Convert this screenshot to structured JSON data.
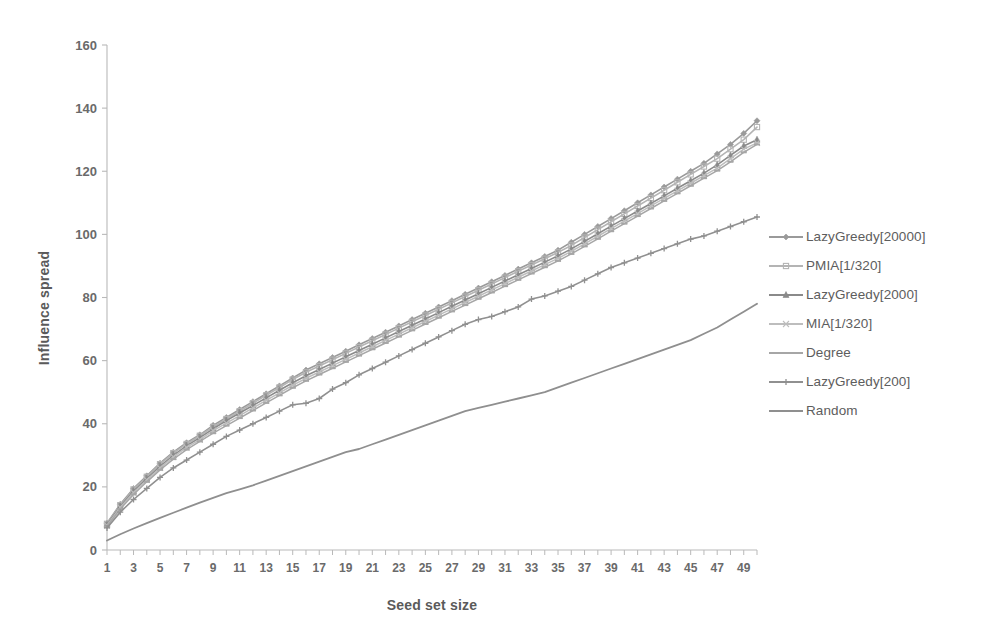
{
  "chart_data": {
    "type": "line",
    "title": "",
    "xlabel": "Seed set size",
    "ylabel": "Influence spread",
    "xlim": [
      1,
      50
    ],
    "ylim": [
      0,
      160
    ],
    "ytick_values": [
      0,
      20,
      40,
      60,
      80,
      100,
      120,
      140,
      160
    ],
    "ytick_labels": [
      "0",
      "20",
      "40",
      "60",
      "80",
      "100",
      "120",
      "140",
      "160"
    ],
    "xtick_values": [
      1,
      3,
      5,
      7,
      9,
      11,
      13,
      15,
      17,
      19,
      21,
      23,
      25,
      27,
      29,
      31,
      33,
      35,
      37,
      39,
      41,
      43,
      45,
      47,
      49
    ],
    "xtick_labels": [
      "1",
      "3",
      "5",
      "7",
      "9",
      "11",
      "13",
      "15",
      "17",
      "19",
      "21",
      "23",
      "25",
      "27",
      "29",
      "31",
      "33",
      "35",
      "37",
      "39",
      "41",
      "43",
      "45",
      "47",
      "49"
    ],
    "x": [
      1,
      2,
      3,
      4,
      5,
      6,
      7,
      8,
      9,
      10,
      11,
      12,
      13,
      14,
      15,
      16,
      17,
      18,
      19,
      20,
      21,
      22,
      23,
      24,
      25,
      26,
      27,
      28,
      29,
      30,
      31,
      32,
      33,
      34,
      35,
      36,
      37,
      38,
      39,
      40,
      41,
      42,
      43,
      44,
      45,
      46,
      47,
      48,
      49,
      50
    ],
    "grid": false,
    "legend_position": "right",
    "series": [
      {
        "name": "LazyGreedy[20000]",
        "color": "#9a9a9a",
        "marker": "diamond",
        "width": 1.6,
        "values": [
          8.5,
          14.5,
          19.5,
          23.5,
          27.5,
          31,
          34,
          36.5,
          39.5,
          42,
          44.5,
          47,
          49.5,
          52,
          54.5,
          57,
          59,
          61,
          63,
          65,
          67,
          69,
          71,
          73,
          75,
          77,
          79,
          81,
          83,
          85,
          87,
          89,
          91,
          93,
          95,
          97.5,
          100,
          102.5,
          105,
          107.5,
          110,
          112.5,
          115,
          117.5,
          120,
          122.5,
          125.5,
          128.5,
          132,
          136
        ]
      },
      {
        "name": "PMIA[1/320]",
        "color": "#b4b4b4",
        "marker": "square",
        "width": 1.6,
        "values": [
          8.3,
          14.2,
          19.2,
          23.2,
          27.2,
          30.7,
          33.6,
          36.2,
          39,
          41.5,
          44,
          46.5,
          49,
          51.5,
          54,
          56.3,
          58.3,
          60.3,
          62.3,
          64.3,
          66.3,
          68.3,
          70.3,
          72.3,
          74.3,
          76.3,
          78.3,
          80.3,
          82.3,
          84.3,
          86.3,
          88.3,
          90.3,
          92.3,
          94.3,
          96.5,
          99,
          101.5,
          104,
          106.5,
          109,
          111.5,
          114,
          116.5,
          119,
          121.5,
          124,
          127,
          130,
          134
        ]
      },
      {
        "name": "LazyGreedy[2000]",
        "color": "#8a8a8a",
        "marker": "triangle",
        "width": 1.6,
        "values": [
          8,
          13.8,
          18.6,
          22.6,
          26.5,
          30,
          33,
          35.6,
          38.4,
          41,
          43.4,
          45.8,
          48.2,
          50.6,
          53,
          55.2,
          57.2,
          59.2,
          61.2,
          63.2,
          65.2,
          67.2,
          69.2,
          71.2,
          73.2,
          75.2,
          77.2,
          79.2,
          81.2,
          83.2,
          85.2,
          87.2,
          89.2,
          91.2,
          93.2,
          95.4,
          97.8,
          100.2,
          102.6,
          105,
          107.4,
          109.8,
          112.2,
          114.6,
          117,
          119.4,
          122,
          125,
          128,
          130
        ]
      },
      {
        "name": "MIA[1/320]",
        "color": "#bdbdbd",
        "marker": "cross",
        "width": 1.5,
        "values": [
          7.8,
          13.5,
          18.2,
          22.2,
          26,
          29.5,
          32.5,
          35,
          37.8,
          40.2,
          42.6,
          45,
          47.4,
          49.8,
          52.2,
          54.4,
          56.4,
          58.4,
          60.4,
          62.4,
          64.4,
          66.4,
          68.4,
          70.4,
          72.4,
          74.4,
          76.4,
          78.4,
          80.4,
          82.4,
          84.4,
          86.4,
          88.4,
          90.4,
          92.4,
          94.6,
          97,
          99.4,
          101.8,
          104.2,
          106.6,
          109,
          111.4,
          113.8,
          116.2,
          118.6,
          121,
          124,
          127,
          129
        ]
      },
      {
        "name": "Degree",
        "color": "#a6a6a6",
        "marker": "dash",
        "width": 1.5,
        "values": [
          7.5,
          13,
          17.6,
          21.6,
          25.4,
          28.8,
          31.8,
          34.4,
          37,
          39.4,
          41.8,
          44.2,
          46.6,
          49,
          51.4,
          53.6,
          55.6,
          57.6,
          59.6,
          61.6,
          63.6,
          65.6,
          67.6,
          69.6,
          71.6,
          73.6,
          75.6,
          77.6,
          79.6,
          81.6,
          83.6,
          85.6,
          87.6,
          89.6,
          91.6,
          93.8,
          96.2,
          98.6,
          101,
          103.4,
          105.8,
          108.2,
          110.6,
          113,
          115.4,
          117.8,
          120.2,
          123,
          126,
          128.5
        ]
      },
      {
        "name": "LazyGreedy[200]",
        "color": "#909090",
        "marker": "plus",
        "width": 1.6,
        "values": [
          7,
          12,
          16,
          19.5,
          23,
          26,
          28.5,
          31,
          33.5,
          36,
          38,
          40,
          42,
          44,
          46,
          46.5,
          48,
          51,
          53,
          55.5,
          57.5,
          59.5,
          61.5,
          63.5,
          65.5,
          67.5,
          69.5,
          71.5,
          73,
          74,
          75.5,
          77,
          79.5,
          80.5,
          82,
          83.5,
          85.5,
          87.5,
          89.5,
          91,
          92.5,
          94,
          95.5,
          97,
          98.5,
          99.5,
          101,
          102.5,
          104,
          105.5
        ]
      },
      {
        "name": "Random",
        "color": "#8f8f8f",
        "marker": "none",
        "width": 1.8,
        "values": [
          3,
          5,
          6.8,
          8.5,
          10.2,
          11.8,
          13.4,
          15,
          16.5,
          18,
          19.2,
          20.5,
          22,
          23.5,
          25,
          26.5,
          28,
          29.5,
          31,
          32,
          33.5,
          35,
          36.5,
          38,
          39.5,
          41,
          42.5,
          44,
          45,
          46,
          47,
          48,
          49,
          50,
          51.5,
          53,
          54.5,
          56,
          57.5,
          59,
          60.5,
          62,
          63.5,
          65,
          66.5,
          68.5,
          70.5,
          73,
          75.5,
          78
        ]
      }
    ]
  },
  "legend": {
    "items": [
      {
        "label": "LazyGreedy[20000]"
      },
      {
        "label": "PMIA[1/320]"
      },
      {
        "label": "LazyGreedy[2000]"
      },
      {
        "label": "MIA[1/320]"
      },
      {
        "label": "Degree"
      },
      {
        "label": "LazyGreedy[200]"
      },
      {
        "label": "Random"
      }
    ]
  },
  "axes": {
    "x_title": "Seed set size",
    "y_title": "Influence spread"
  },
  "colors": {
    "background": "#ffffff",
    "axis": "#b9b9b9",
    "text": "#5d5d5d"
  }
}
